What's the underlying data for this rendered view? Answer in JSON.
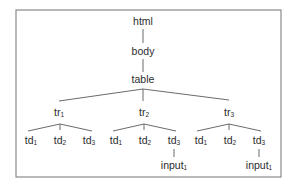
{
  "diagram": {
    "title": "",
    "type": "DOM tree",
    "frame": {
      "x": 16,
      "y": 10,
      "width": 265,
      "height": 167,
      "color": "#8a8a8a"
    },
    "nodes": [
      {
        "id": "html",
        "label": "html",
        "sub": "",
        "x": 143,
        "y": 22
      },
      {
        "id": "body",
        "label": "body",
        "sub": "",
        "x": 143,
        "y": 52
      },
      {
        "id": "table",
        "label": "table",
        "sub": "",
        "x": 143,
        "y": 80
      },
      {
        "id": "tr1",
        "label": "tr",
        "sub": "1",
        "x": 59,
        "y": 113
      },
      {
        "id": "tr2",
        "label": "tr",
        "sub": "2",
        "x": 144,
        "y": 113
      },
      {
        "id": "tr3",
        "label": "tr",
        "sub": "3",
        "x": 229,
        "y": 113
      },
      {
        "id": "tr1_td1",
        "label": "td",
        "sub": "1",
        "x": 31,
        "y": 141
      },
      {
        "id": "tr1_td2",
        "label": "td",
        "sub": "2",
        "x": 60,
        "y": 141
      },
      {
        "id": "tr1_td3",
        "label": "td",
        "sub": "3",
        "x": 89,
        "y": 141
      },
      {
        "id": "tr2_td1",
        "label": "td",
        "sub": "1",
        "x": 116,
        "y": 141
      },
      {
        "id": "tr2_td2",
        "label": "td",
        "sub": "2",
        "x": 145,
        "y": 141
      },
      {
        "id": "tr2_td3",
        "label": "td",
        "sub": "3",
        "x": 174,
        "y": 141
      },
      {
        "id": "tr2_input1",
        "label": "input",
        "sub": "1",
        "x": 174,
        "y": 166
      },
      {
        "id": "tr3_td1",
        "label": "td",
        "sub": "1",
        "x": 201,
        "y": 141
      },
      {
        "id": "tr3_td2",
        "label": "td",
        "sub": "2",
        "x": 230,
        "y": 141
      },
      {
        "id": "tr3_td3",
        "label": "td",
        "sub": "3",
        "x": 259,
        "y": 141
      },
      {
        "id": "tr3_input1",
        "label": "input",
        "sub": "1",
        "x": 259,
        "y": 166
      }
    ],
    "edges": [
      {
        "from": "html",
        "to": "body",
        "x1": 143,
        "y1": 29,
        "x2": 143,
        "y2": 43
      },
      {
        "from": "body",
        "to": "table",
        "x1": 143,
        "y1": 59,
        "x2": 143,
        "y2": 72
      },
      {
        "from": "table",
        "to": "tr1",
        "x1": 143,
        "y1": 89,
        "x2": 59,
        "y2": 101
      },
      {
        "from": "table",
        "to": "tr2",
        "x1": 143,
        "y1": 89,
        "x2": 143,
        "y2": 101
      },
      {
        "from": "table",
        "to": "tr3",
        "x1": 143,
        "y1": 89,
        "x2": 229,
        "y2": 100
      },
      {
        "from": "tr1",
        "to": "tr1_td1",
        "x1": 60,
        "y1": 124,
        "x2": 28,
        "y2": 131
      },
      {
        "from": "tr1",
        "to": "tr1_td2",
        "x1": 60,
        "y1": 124,
        "x2": 60,
        "y2": 130
      },
      {
        "from": "tr1",
        "to": "tr1_td3",
        "x1": 60,
        "y1": 124,
        "x2": 92,
        "y2": 131
      },
      {
        "from": "tr2",
        "to": "tr2_td1",
        "x1": 144,
        "y1": 124,
        "x2": 113,
        "y2": 131
      },
      {
        "from": "tr2",
        "to": "tr2_td2",
        "x1": 144,
        "y1": 124,
        "x2": 144,
        "y2": 130
      },
      {
        "from": "tr2",
        "to": "tr2_td3",
        "x1": 144,
        "y1": 124,
        "x2": 176,
        "y2": 131
      },
      {
        "from": "tr2_td3",
        "to": "tr2_input1",
        "x1": 174,
        "y1": 149,
        "x2": 174,
        "y2": 157
      },
      {
        "from": "tr3",
        "to": "tr3_td1",
        "x1": 229,
        "y1": 124,
        "x2": 197,
        "y2": 131
      },
      {
        "from": "tr3",
        "to": "tr3_td2",
        "x1": 229,
        "y1": 124,
        "x2": 229,
        "y2": 130
      },
      {
        "from": "tr3",
        "to": "tr3_td3",
        "x1": 229,
        "y1": 124,
        "x2": 261,
        "y2": 131
      },
      {
        "from": "tr3_td3",
        "to": "tr3_input1",
        "x1": 259,
        "y1": 149,
        "x2": 259,
        "y2": 157
      }
    ]
  }
}
